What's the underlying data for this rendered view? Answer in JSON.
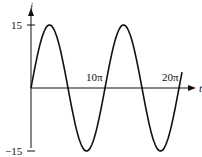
{
  "chart_data": {
    "type": "line",
    "title": "",
    "xlabel": "t",
    "ylabel": "i",
    "function": "i = 15 sin(t/5)",
    "x_ticks": [
      "10π",
      "20π"
    ],
    "y_ticks": [
      "15",
      "−15"
    ],
    "xlim": [
      0,
      "21π"
    ],
    "ylim": [
      -15,
      15
    ],
    "amplitude": 15,
    "period": "10π",
    "x": [
      "0",
      "2.5π",
      "5π",
      "7.5π",
      "10π",
      "12.5π",
      "15π",
      "17.5π",
      "20π"
    ],
    "values": [
      0,
      15,
      0,
      -15,
      0,
      15,
      0,
      -15,
      0
    ],
    "grid": false,
    "legend": null
  },
  "labels": {
    "y_axis": "i",
    "x_axis": "t",
    "y_max": "15",
    "y_min": "−15",
    "x_tick_1": "10π",
    "x_tick_2": "20π"
  },
  "colors": {
    "curve": "#111111",
    "axes": "#111111"
  }
}
